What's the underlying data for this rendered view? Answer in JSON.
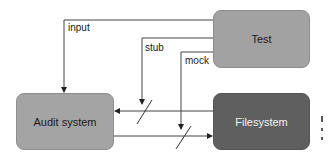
{
  "diagram": {
    "nodes": [
      {
        "id": "test",
        "label": "Test",
        "fill": "#a2a2a2"
      },
      {
        "id": "audit",
        "label": "Audit system",
        "fill": "#a4a4a4"
      },
      {
        "id": "filesystem",
        "label": "Filesystem",
        "fill": "#5f5f5f"
      }
    ],
    "edges": [
      {
        "from": "test",
        "to": "audit",
        "label": "input"
      },
      {
        "from": "test",
        "to": "audit-fs-read-link",
        "label": "stub"
      },
      {
        "from": "test",
        "to": "audit-fs-write-link",
        "label": "mock"
      },
      {
        "from": "filesystem",
        "to": "audit",
        "label": "",
        "severed": true
      },
      {
        "from": "audit",
        "to": "filesystem",
        "label": "",
        "severed": true
      }
    ],
    "colors": {
      "line": "#333333",
      "text_dark": "#1a1a1a",
      "text_light": "#f2f2f2"
    }
  }
}
